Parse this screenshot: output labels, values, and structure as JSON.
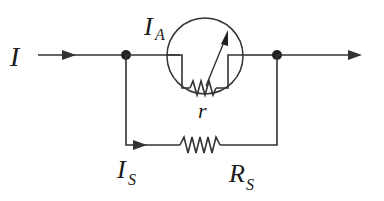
{
  "diagram": {
    "labels": {
      "input_current": "I",
      "ammeter_current": "I",
      "ammeter_current_sub": "A",
      "internal_resistance": "r",
      "shunt_current": "I",
      "shunt_current_sub": "S",
      "shunt_resistor": "R",
      "shunt_resistor_sub": "S"
    },
    "colors": {
      "line": "#333333",
      "text": "#1a1a1a",
      "background": "#ffffff"
    },
    "components": [
      {
        "type": "ammeter",
        "label": "r",
        "current": "I_A"
      },
      {
        "type": "resistor",
        "label": "R_S",
        "current": "I_S"
      }
    ]
  }
}
